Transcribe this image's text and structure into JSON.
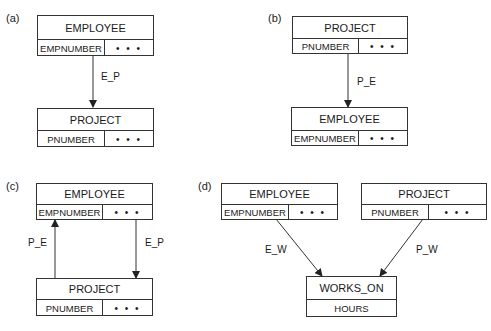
{
  "panels": [
    {
      "label": "(a)",
      "entities": [
        {
          "name": "EMPLOYEE",
          "key": "EMPNUMBER",
          "more": "• • •"
        },
        {
          "name": "PROJECT",
          "key": "PNUMBER",
          "more": "• • •"
        }
      ],
      "relationships": [
        {
          "label": "E_P",
          "from": "EMPLOYEE",
          "to": "PROJECT"
        }
      ]
    },
    {
      "label": "(b)",
      "entities": [
        {
          "name": "PROJECT",
          "key": "PNUMBER",
          "more": "• • •"
        },
        {
          "name": "EMPLOYEE",
          "key": "EMPNUMBER",
          "more": "• • •"
        }
      ],
      "relationships": [
        {
          "label": "P_E",
          "from": "PROJECT",
          "to": "EMPLOYEE"
        }
      ]
    },
    {
      "label": "(c)",
      "entities": [
        {
          "name": "EMPLOYEE",
          "key": "EMPNUMBER",
          "more": "• • •"
        },
        {
          "name": "PROJECT",
          "key": "PNUMBER",
          "more": "• • •"
        }
      ],
      "relationships": [
        {
          "label": "P_E",
          "from": "PROJECT",
          "to": "EMPLOYEE"
        },
        {
          "label": "E_P",
          "from": "EMPLOYEE",
          "to": "PROJECT"
        }
      ]
    },
    {
      "label": "(d)",
      "entities": [
        {
          "name": "EMPLOYEE",
          "key": "EMPNUMBER",
          "more": "• • •"
        },
        {
          "name": "PROJECT",
          "key": "PNUMBER",
          "more": "• • •"
        },
        {
          "name": "WORKS_ON",
          "attribute": "HOURS"
        }
      ],
      "relationships": [
        {
          "label": "E_W",
          "from": "EMPLOYEE",
          "to": "WORKS_ON"
        },
        {
          "label": "P_W",
          "from": "PROJECT",
          "to": "WORKS_ON"
        }
      ]
    }
  ]
}
